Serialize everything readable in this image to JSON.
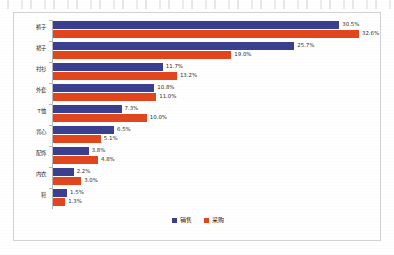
{
  "chart_data": {
    "type": "bar",
    "orientation": "horizontal",
    "title": "",
    "subtitle": "",
    "xlabel": "",
    "ylabel": "",
    "grid": false,
    "legend_position": "bottom-center",
    "xlim": [
      0,
      32.6
    ],
    "categories": [
      "裤子",
      "裙子",
      "衬衫",
      "外套",
      "T恤",
      "背心",
      "配饰",
      "内衣",
      "鞋"
    ],
    "series": [
      {
        "name": "销售",
        "color": "#3b3f8f",
        "values": [
          30.5,
          25.7,
          11.7,
          10.8,
          7.3,
          6.5,
          3.8,
          2.2,
          1.5
        ],
        "labels": [
          "30.5%",
          "25.7%",
          "11.7%",
          "10.8%",
          "7.3%",
          "6.5%",
          "3.8%",
          "2.2%",
          "1.5%"
        ]
      },
      {
        "name": "采购",
        "color": "#e2461c",
        "values": [
          32.6,
          19.0,
          13.2,
          11.0,
          10.0,
          5.1,
          4.8,
          3.0,
          1.3
        ],
        "labels": [
          "32.6%",
          "19.0%",
          "13.2%",
          "11.0%",
          "10.0%",
          "5.1%",
          "4.8%",
          "3.0%",
          "1.3%"
        ]
      }
    ]
  },
  "legend": {
    "entries": [
      {
        "label": "销售",
        "color": "#3b3f8f"
      },
      {
        "label": "采购",
        "color": "#e2461c"
      }
    ]
  },
  "colors": {
    "sales": "#3b3f8f",
    "procurement": "#e2461c",
    "frame_border": "#d2d2d4",
    "axis_line": "#b9b9bb",
    "label_text": "#2d2d2d",
    "background": "#ffffff"
  }
}
